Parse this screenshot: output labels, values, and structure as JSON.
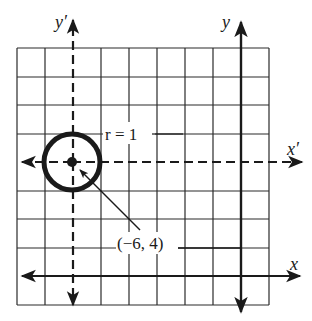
{
  "diagram": {
    "type": "coordinate-translation",
    "grid": {
      "columns": 9,
      "rows": 9,
      "left": 17,
      "top": 48,
      "cell_w": 28,
      "cell_h": 28.5
    },
    "axes": {
      "x": {
        "label": "x",
        "style": "solid"
      },
      "y": {
        "label": "y",
        "style": "solid"
      },
      "x_prime": {
        "label": "x′",
        "style": "dashed"
      },
      "y_prime": {
        "label": "y′",
        "style": "dashed"
      }
    },
    "circle": {
      "center_label": "(−6, 4)",
      "radius_label": "r = 1",
      "center": [
        -6,
        4
      ],
      "radius": 1
    },
    "colors": {
      "ink": "#1a1a1a",
      "grid": "#2a2a2a",
      "background": "#ffffff"
    }
  }
}
